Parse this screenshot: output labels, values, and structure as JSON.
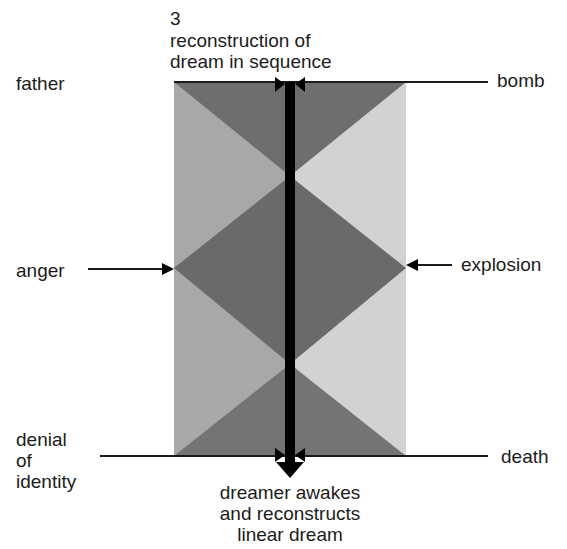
{
  "title": {
    "number": "3",
    "line1": "reconstruction of",
    "line2": "dream in sequence"
  },
  "left_labels": {
    "top": "father",
    "middle": "anger",
    "bottom_line1": "denial",
    "bottom_line2": "of",
    "bottom_line3": "identity"
  },
  "right_labels": {
    "top": "bomb",
    "middle": "explosion",
    "bottom": "death"
  },
  "caption": {
    "line1": "dreamer awakes",
    "line2": "and reconstructs",
    "line3": "linear dream"
  },
  "colors": {
    "dark_gray": "#6e6e6e",
    "mid_gray_left": "#a9a9a9",
    "light_gray_right": "#cfcfcf",
    "bar": "#000000",
    "line": "#1a1a1a"
  }
}
